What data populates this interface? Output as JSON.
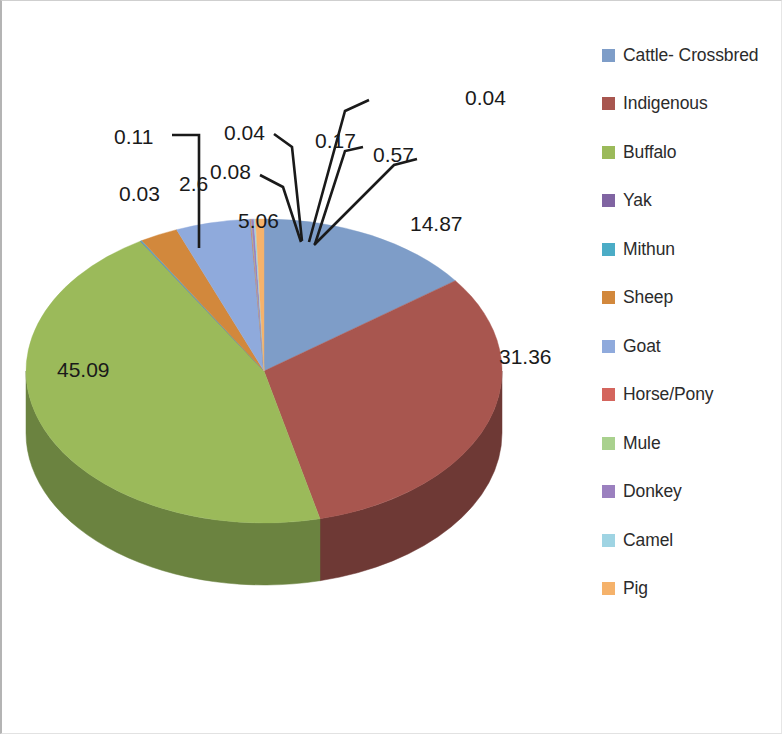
{
  "chart_data": {
    "type": "pie",
    "title": "",
    "subtitle": "",
    "xlabel": "",
    "ylabel": "",
    "three_d": true,
    "grid": false,
    "legend_position": "right",
    "value_unit": "percent",
    "categories": [
      "Cattle- Crossbred",
      "Indigenous",
      "Buffalo",
      "Yak",
      "Mithun",
      "Sheep",
      "Goat",
      "Horse/Pony",
      "Mule",
      "Donkey",
      "Camel",
      "Pig"
    ],
    "values": [
      14.87,
      31.36,
      45.09,
      0.03,
      0.08,
      2.6,
      5.06,
      0.04,
      0.04,
      0.17,
      0.11,
      0.57
    ],
    "labels": [
      "14.87",
      "31.36",
      "45.09",
      "0.03",
      "0.08",
      "2.6",
      "5.06",
      "0.04",
      "0.04",
      "0.17",
      "0.11",
      "0.57"
    ],
    "colors": [
      "#7e9dc8",
      "#a8564f",
      "#9bba5a",
      "#8064a2",
      "#4bacc6",
      "#d2883c",
      "#8faadc",
      "#d4655d",
      "#a9d18e",
      "#9b80bf",
      "#9fd4e3",
      "#f5b26b"
    ],
    "side_colors": [
      "#54698a",
      "#6e3935",
      "#6b8340",
      "#574471",
      "#347886",
      "#8e5c28",
      "#62759a",
      "#8f4540",
      "#748f61",
      "#6a5783",
      "#6e9199",
      "#a87948"
    ],
    "series_name": "Livestock population share"
  },
  "legend": {
    "items": [
      {
        "label": "Cattle- Crossbred",
        "color": "#7e9dc8"
      },
      {
        "label": "Indigenous",
        "color": "#a8564f"
      },
      {
        "label": "Buffalo",
        "color": "#9bba5a"
      },
      {
        "label": "Yak",
        "color": "#8064a2"
      },
      {
        "label": "Mithun",
        "color": "#4bacc6"
      },
      {
        "label": "Sheep",
        "color": "#d2883c"
      },
      {
        "label": "Goat",
        "color": "#8faadc"
      },
      {
        "label": "Horse/Pony",
        "color": "#d4655d"
      },
      {
        "label": "Mule",
        "color": "#a9d18e"
      },
      {
        "label": "Donkey",
        "color": "#9b80bf"
      },
      {
        "label": "Camel",
        "color": "#9fd4e3"
      },
      {
        "label": "Pig",
        "color": "#f5b26b"
      }
    ]
  },
  "data_labels": [
    {
      "text": "0.04",
      "x": 463,
      "y": 86
    },
    {
      "text": "0.11",
      "x": 112,
      "y": 125
    },
    {
      "text": "0.04",
      "x": 222,
      "y": 121
    },
    {
      "text": "0.17",
      "x": 313,
      "y": 129
    },
    {
      "text": "0.57",
      "x": 371,
      "y": 143
    },
    {
      "text": "0.03",
      "x": 117,
      "y": 182
    },
    {
      "text": "2.6",
      "x": 177,
      "y": 172
    },
    {
      "text": "0.08",
      "x": 208,
      "y": 160
    },
    {
      "text": "5.06",
      "x": 236,
      "y": 209
    },
    {
      "text": "14.87",
      "x": 408,
      "y": 212
    },
    {
      "text": "31.36",
      "x": 497,
      "y": 345
    },
    {
      "text": "45.09",
      "x": 55,
      "y": 358
    }
  ]
}
